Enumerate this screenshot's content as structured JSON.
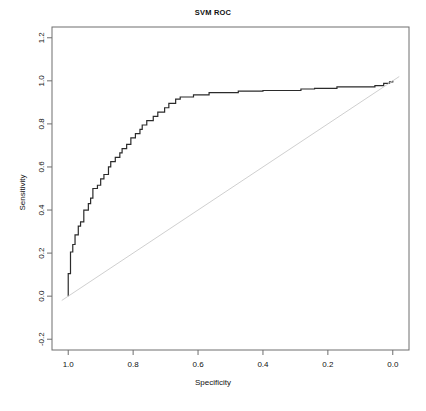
{
  "chart_data": {
    "type": "line",
    "title": "SVM ROC",
    "xlabel": "Specificity",
    "ylabel": "Sensitivity",
    "xlim": [
      1.05,
      -0.05
    ],
    "ylim": [
      -0.25,
      1.25
    ],
    "x_reversed": true,
    "grid": false,
    "legend": null,
    "xticks": [
      "1.0",
      "0.8",
      "0.6",
      "0.4",
      "0.2",
      "0.0"
    ],
    "xtick_values": [
      1.0,
      0.8,
      0.6,
      0.4,
      0.2,
      0.0
    ],
    "yticks": [
      "-0.2",
      "0.0",
      "0.2",
      "0.4",
      "0.6",
      "0.8",
      "1.0",
      "1.2"
    ],
    "ytick_values": [
      -0.2,
      0.0,
      0.2,
      0.4,
      0.6,
      0.8,
      1.0,
      1.2
    ],
    "series": [
      {
        "name": "ROC curve",
        "color": "#2b2b2b",
        "width": 1.2,
        "style": "step",
        "points": [
          [
            1.0,
            0.0
          ],
          [
            1.0,
            0.105
          ],
          [
            0.993,
            0.105
          ],
          [
            0.993,
            0.205
          ],
          [
            0.986,
            0.205
          ],
          [
            0.986,
            0.24
          ],
          [
            0.979,
            0.24
          ],
          [
            0.979,
            0.285
          ],
          [
            0.969,
            0.285
          ],
          [
            0.969,
            0.325
          ],
          [
            0.962,
            0.325
          ],
          [
            0.962,
            0.345
          ],
          [
            0.952,
            0.345
          ],
          [
            0.952,
            0.4
          ],
          [
            0.938,
            0.4
          ],
          [
            0.938,
            0.43
          ],
          [
            0.931,
            0.43
          ],
          [
            0.931,
            0.455
          ],
          [
            0.924,
            0.455
          ],
          [
            0.924,
            0.5
          ],
          [
            0.91,
            0.5
          ],
          [
            0.91,
            0.515
          ],
          [
            0.9,
            0.515
          ],
          [
            0.9,
            0.545
          ],
          [
            0.89,
            0.545
          ],
          [
            0.89,
            0.565
          ],
          [
            0.876,
            0.565
          ],
          [
            0.876,
            0.6
          ],
          [
            0.869,
            0.6
          ],
          [
            0.869,
            0.625
          ],
          [
            0.855,
            0.625
          ],
          [
            0.855,
            0.645
          ],
          [
            0.841,
            0.645
          ],
          [
            0.841,
            0.665
          ],
          [
            0.834,
            0.665
          ],
          [
            0.834,
            0.685
          ],
          [
            0.82,
            0.685
          ],
          [
            0.82,
            0.705
          ],
          [
            0.807,
            0.705
          ],
          [
            0.807,
            0.735
          ],
          [
            0.793,
            0.735
          ],
          [
            0.793,
            0.755
          ],
          [
            0.779,
            0.755
          ],
          [
            0.779,
            0.775
          ],
          [
            0.772,
            0.775
          ],
          [
            0.772,
            0.795
          ],
          [
            0.758,
            0.795
          ],
          [
            0.758,
            0.815
          ],
          [
            0.738,
            0.815
          ],
          [
            0.738,
            0.835
          ],
          [
            0.724,
            0.835
          ],
          [
            0.724,
            0.855
          ],
          [
            0.703,
            0.855
          ],
          [
            0.703,
            0.875
          ],
          [
            0.69,
            0.875
          ],
          [
            0.69,
            0.895
          ],
          [
            0.669,
            0.895
          ],
          [
            0.669,
            0.915
          ],
          [
            0.655,
            0.915
          ],
          [
            0.655,
            0.925
          ],
          [
            0.614,
            0.925
          ],
          [
            0.614,
            0.935
          ],
          [
            0.566,
            0.935
          ],
          [
            0.566,
            0.945
          ],
          [
            0.476,
            0.945
          ],
          [
            0.476,
            0.952
          ],
          [
            0.4,
            0.952
          ],
          [
            0.4,
            0.955
          ],
          [
            0.283,
            0.955
          ],
          [
            0.283,
            0.962
          ],
          [
            0.241,
            0.962
          ],
          [
            0.241,
            0.965
          ],
          [
            0.172,
            0.965
          ],
          [
            0.172,
            0.972
          ],
          [
            0.055,
            0.972
          ],
          [
            0.055,
            0.978
          ],
          [
            0.028,
            0.978
          ],
          [
            0.028,
            0.988
          ],
          [
            0.01,
            0.988
          ],
          [
            0.01,
            0.995
          ],
          [
            0.0,
            0.995
          ],
          [
            0.0,
            1.0
          ]
        ]
      },
      {
        "name": "chance diagonal",
        "color": "#c9c9c9",
        "width": 0.9,
        "style": "line",
        "points": [
          [
            1.02,
            -0.02
          ],
          [
            -0.02,
            1.02
          ]
        ]
      }
    ]
  },
  "figure": {
    "title": "SVM ROC",
    "xlabel": "Specificity",
    "ylabel": "Sensitivity"
  }
}
